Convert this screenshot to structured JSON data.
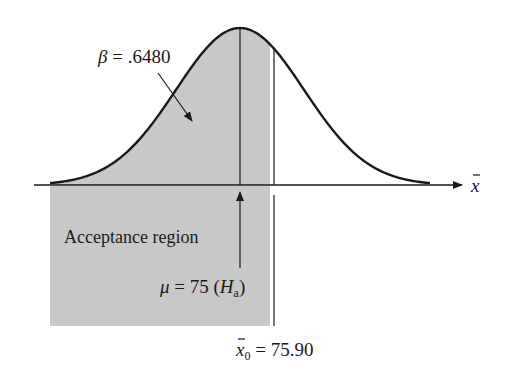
{
  "diagram": {
    "type": "normal-distribution-beta-region",
    "beta_label": {
      "symbol": "β",
      "text": " = .6480"
    },
    "mean_label": {
      "symbol": "μ",
      "text": " = 75 (",
      "h": "H",
      "sub": "a",
      "close": ")"
    },
    "critical_label": {
      "symbol": "x",
      "sub": "0",
      "text": " = 75.90"
    },
    "axis_label": {
      "symbol": "x"
    },
    "region_label": "Acceptance region",
    "values": {
      "beta": 0.648,
      "mu_Ha": 75,
      "x0": 75.9
    },
    "colors": {
      "shade": "#c8c8c8",
      "ink": "#1a1a1a",
      "background": "#ffffff"
    }
  }
}
